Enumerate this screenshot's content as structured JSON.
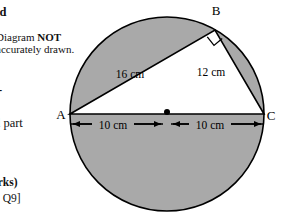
{
  "page": {
    "width": 281,
    "height": 222,
    "background": "#ffffff"
  },
  "question_text": {
    "fragment_top": "ed",
    "note_line_1_prefix": "Diagram ",
    "note_line_1_emphasis": "NOT",
    "note_line_2": "accurately drawn.",
    "fragment_dash": "-",
    "fragment_part": "d part",
    "fragment_marks": "arks)",
    "fragment_reference": "3 Q9]"
  },
  "diagram": {
    "colors": {
      "shaded_fill": "#a9a9a9",
      "unshaded_fill": "#ffffff",
      "stroke": "#000000"
    },
    "circle": {
      "center_x": 167,
      "center_y": 114,
      "radius": 97
    },
    "points": [
      {
        "id": "A",
        "label": "A",
        "x": 70,
        "y": 114,
        "label_x": 61,
        "label_y": 119
      },
      {
        "id": "B",
        "label": "B",
        "x": 215,
        "y": 30,
        "label_x": 216,
        "label_y": 15
      },
      {
        "id": "C",
        "label": "C",
        "x": 264,
        "y": 114,
        "label_x": 269,
        "label_y": 120
      }
    ],
    "center_marker": {
      "label": "center-dot",
      "x": 167,
      "y": 112,
      "radius": 3
    },
    "right_angle": {
      "at_point": "B",
      "label": "right-angle-marker",
      "size": 11
    },
    "side_labels": [
      {
        "id": "AB",
        "text": "16 cm",
        "x": 130,
        "y": 78
      },
      {
        "id": "BC",
        "text": "12 cm",
        "x": 211,
        "y": 76
      }
    ],
    "dimensions": [
      {
        "id": "A-to-center",
        "text": "10 cm",
        "text_x": 101,
        "text_y": 130,
        "from_x": 71,
        "to_x": 163,
        "y": 124
      },
      {
        "id": "center-to-C",
        "text": "10 cm",
        "text_x": 198,
        "text_y": 130,
        "from_x": 263,
        "to_x": 171,
        "y": 124
      }
    ]
  }
}
